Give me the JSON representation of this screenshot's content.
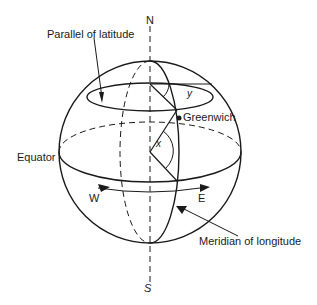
{
  "diagram": {
    "labels": {
      "north": "N",
      "south": "S",
      "parallel": "Parallel of latitude",
      "greenwich": "Greenwich",
      "equator": "Equator",
      "west": "W",
      "east": "E",
      "meridian": "Meridian of longitude",
      "angle_x": "x",
      "angle_y": "y"
    },
    "colors": {
      "line": "#1a1a1a",
      "background": "#ffffff"
    }
  }
}
